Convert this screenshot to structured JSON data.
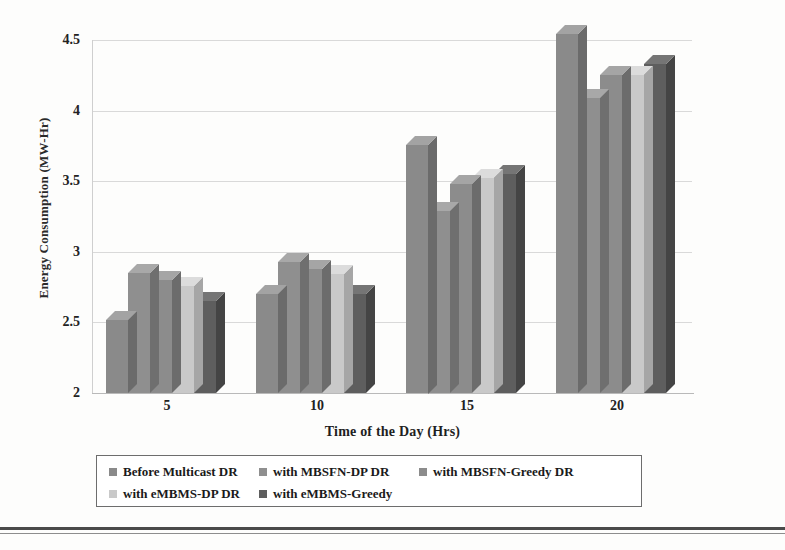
{
  "chart_data": {
    "type": "bar",
    "title": "",
    "subtitle": "",
    "xlabel": "Time of the Day (Hrs)",
    "ylabel": "Energy Consumption (MW-Hr)",
    "categories": [
      "5",
      "10",
      "15",
      "20"
    ],
    "ylim": [
      2,
      4.5
    ],
    "yticks": [
      "2",
      "2.5",
      "3",
      "3.5",
      "4",
      "4.5"
    ],
    "ytick_values": [
      2,
      2.5,
      3,
      3.5,
      4,
      4.5
    ],
    "grid": true,
    "legend_position": "bottom",
    "series": [
      {
        "name": "Before Multicast DR",
        "color": "#8a8a8a",
        "top_color": "#a3a3a3",
        "side_color": "#6b6b6b",
        "values": [
          2.52,
          2.7,
          3.76,
          4.54
        ]
      },
      {
        "name": "with MBSFN-DP DR",
        "color": "#8f8f8f",
        "top_color": "#a8a8a8",
        "side_color": "#6f6f6f",
        "values": [
          2.85,
          2.93,
          3.29,
          4.09
        ]
      },
      {
        "name": "with MBSFN-Greedy DR",
        "color": "#8c8c8c",
        "top_color": "#a5a5a5",
        "side_color": "#6c6c6c",
        "values": [
          2.8,
          2.88,
          3.48,
          4.25
        ]
      },
      {
        "name": "with eMBMS-DP DR",
        "color": "#c9c9c9",
        "top_color": "#dcdcdc",
        "side_color": "#a6a6a6",
        "values": [
          2.76,
          2.84,
          3.52,
          4.25
        ]
      },
      {
        "name": "with eMBMS-Greedy",
        "color": "#5e5e5e",
        "top_color": "#757575",
        "side_color": "#444444",
        "values": [
          2.65,
          2.7,
          3.55,
          4.33
        ]
      }
    ]
  }
}
